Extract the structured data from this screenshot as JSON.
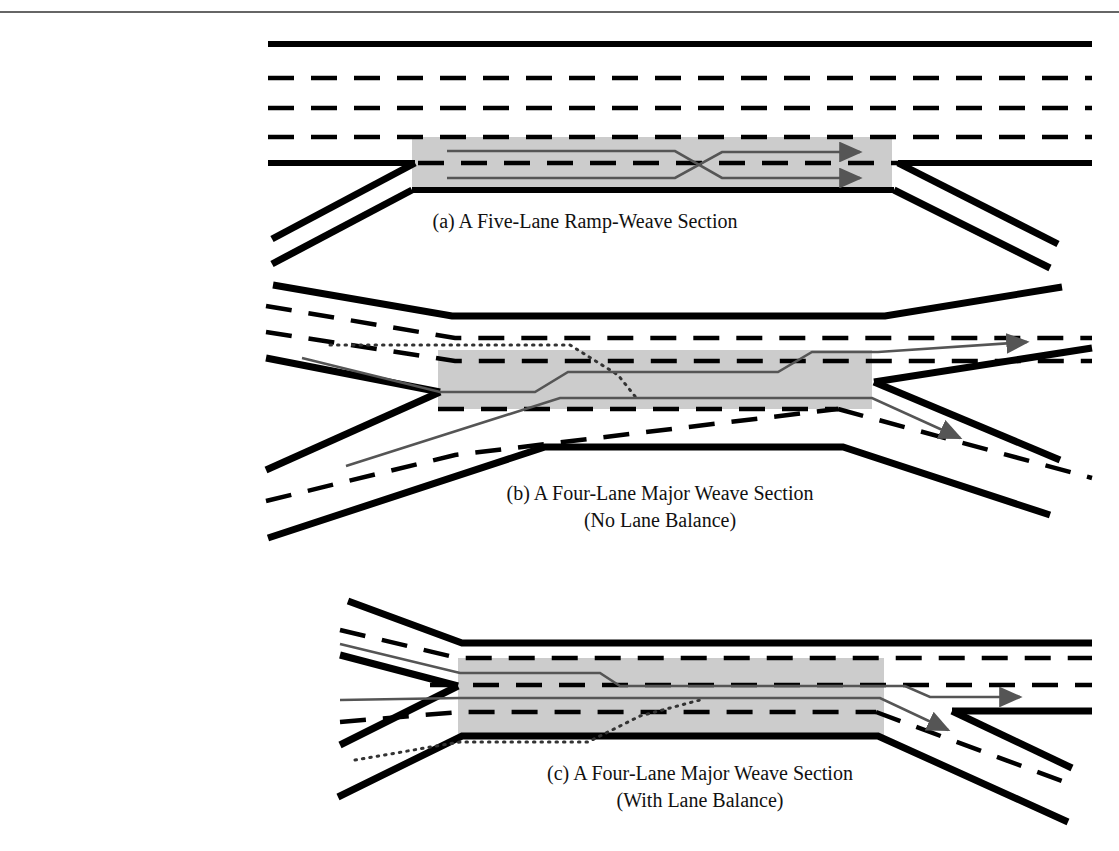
{
  "figure": {
    "name": "weaving-section-configurations",
    "background": "#ffffff",
    "top_rule": {
      "y": 12,
      "color": "#333333"
    },
    "colors": {
      "pavement_edge": "#000000",
      "lane_marking": "#000000",
      "weave_zone_fill": "#cccccc",
      "vehicle_path": "#555555",
      "dotted_path": "#333333"
    }
  },
  "panels": [
    {
      "id": "a",
      "caption": "(a) A Five-Lane Ramp-Weave Section",
      "caption2": "",
      "lanes": 5,
      "type": "ramp-weave",
      "entry": "on-ramp",
      "exit": "off-ramp",
      "paths": [
        {
          "name": "ramp-to-freeway-path",
          "style": "solid",
          "arrow": true
        },
        {
          "name": "freeway-to-ramp-path",
          "style": "solid",
          "arrow": true
        }
      ]
    },
    {
      "id": "b",
      "caption": "(b) A Four-Lane Major Weave Section",
      "caption2": "(No Lane Balance)",
      "lanes": 4,
      "type": "major-weave",
      "balance": "no-lane-balance",
      "paths": [
        {
          "name": "weave-path-upper",
          "style": "solid",
          "arrow": true
        },
        {
          "name": "weave-path-lower",
          "style": "solid",
          "arrow": true
        },
        {
          "name": "optional-path",
          "style": "dotted",
          "arrow": false
        }
      ]
    },
    {
      "id": "c",
      "caption": "(c) A Four-Lane Major Weave Section",
      "caption2": "(With Lane Balance)",
      "lanes": 4,
      "type": "major-weave",
      "balance": "with-lane-balance",
      "paths": [
        {
          "name": "weave-path-upper",
          "style": "solid",
          "arrow": true
        },
        {
          "name": "weave-path-lower",
          "style": "solid",
          "arrow": true
        },
        {
          "name": "optional-path",
          "style": "dotted",
          "arrow": false
        }
      ]
    }
  ]
}
